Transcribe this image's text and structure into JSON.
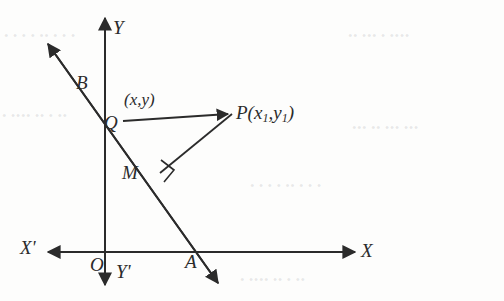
{
  "figure": {
    "ink_color": "#2b2b2b",
    "paper_color": "#fdfdfc",
    "labels": {
      "y_axis_positive": "Y",
      "y_axis_negative": "Y'",
      "x_axis_positive": "X",
      "x_axis_negative": "X'",
      "origin": "O",
      "point_b": "B",
      "point_q": "Q",
      "point_m": "M",
      "point_a": "A",
      "point_q_coords": "(x,y)",
      "point_p_name": "P(x",
      "point_p_sub1": "1",
      "point_p_mid": ",y",
      "point_p_sub2": "1",
      "point_p_close": ")"
    },
    "geometry": {
      "origin": {
        "x": 105,
        "y": 252
      },
      "point_b": {
        "x": 99,
        "y": 74
      },
      "point_q": {
        "x": 123,
        "y": 122
      },
      "point_m": {
        "x": 158,
        "y": 172
      },
      "point_a": {
        "x": 197,
        "y": 252
      },
      "point_p": {
        "x": 232,
        "y": 113
      },
      "x_axis": {
        "from_x": 48,
        "to_x": 355,
        "y": 252
      },
      "y_axis": {
        "x": 105,
        "from_y": 18,
        "to_y": 285
      },
      "slant_line": {
        "from_x": 48,
        "from_y": 44,
        "to_x": 218,
        "to_y": 283
      },
      "right_angle_at": "M"
    },
    "background_ghost_text": [
      "• • • •  •• • • •",
      "•• ••• • ••••",
      "• •••• •• • ••",
      "••• •• ••• •••"
    ]
  }
}
